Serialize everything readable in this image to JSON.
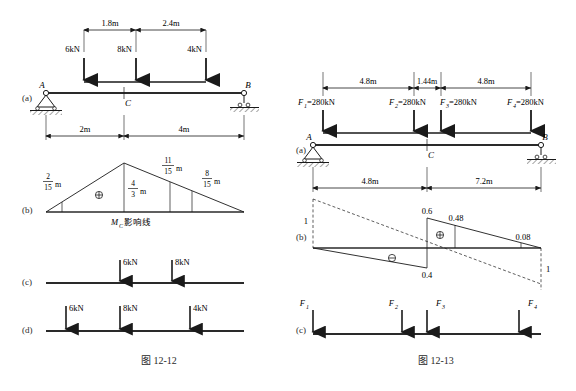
{
  "figures": [
    {
      "id": "fig-12-12",
      "caption": "图 12-12",
      "panels": [
        {
          "label": "(a)",
          "type": "beam-loading",
          "beam": {
            "left_support_label": "A",
            "right_support_label": "B",
            "mid_label": "C",
            "left_support_type": "pin",
            "right_support_type": "roller"
          },
          "loads": [
            {
              "label": "6kN",
              "value": 6,
              "unit": "kN"
            },
            {
              "label": "8kN",
              "value": 8,
              "unit": "kN"
            },
            {
              "label": "4kN",
              "value": 4,
              "unit": "kN"
            }
          ],
          "top_dimensions": [
            {
              "label": "1.8m",
              "value": 1.8
            },
            {
              "label": "2.4m",
              "value": 2.4
            }
          ],
          "bottom_dimensions": [
            {
              "label": "2m",
              "value": 2
            },
            {
              "label": "4m",
              "value": 4
            }
          ]
        },
        {
          "label": "(b)",
          "type": "influence-line",
          "title": "M",
          "title_sub": "C",
          "title_text": "影响线",
          "sign_positive": "⊕",
          "ordinates": [
            {
              "num": "2",
              "den": "15",
              "unit": "m"
            },
            {
              "num": "4",
              "den": "3",
              "unit": "m"
            },
            {
              "num": "11",
              "den": "15",
              "unit": "m"
            },
            {
              "num": "8",
              "den": "15",
              "unit": "m"
            }
          ]
        },
        {
          "label": "(c)",
          "type": "load-case",
          "loads": [
            {
              "label": "6kN"
            },
            {
              "label": "8kN"
            }
          ]
        },
        {
          "label": "(d)",
          "type": "load-case",
          "loads": [
            {
              "label": "6kN"
            },
            {
              "label": "8kN"
            },
            {
              "label": "4kN"
            }
          ]
        }
      ]
    },
    {
      "id": "fig-12-13",
      "caption": "图 12-13",
      "panels": [
        {
          "label": "(a)",
          "type": "beam-loading",
          "beam": {
            "left_support_label": "A",
            "right_support_label": "B",
            "mid_label": "C",
            "left_support_type": "pin",
            "right_support_type": "roller"
          },
          "loads": [
            {
              "name": "F",
              "sub": "1",
              "label": "=280kN"
            },
            {
              "name": "F",
              "sub": "2",
              "label": "=280kN"
            },
            {
              "name": "F",
              "sub": "3",
              "label": "=280kN"
            },
            {
              "name": "F",
              "sub": "4",
              "label": "=280kN"
            }
          ],
          "top_dimensions": [
            {
              "label": "4.8m",
              "value": 4.8
            },
            {
              "label": "1.44m",
              "value": 1.44
            },
            {
              "label": "4.8m",
              "value": 4.8
            }
          ],
          "bottom_dimensions": [
            {
              "label": "4.8m",
              "value": 4.8
            },
            {
              "label": "7.2m",
              "value": 7.2
            }
          ]
        },
        {
          "label": "(b)",
          "type": "influence-line",
          "sign_positive": "⊕",
          "sign_negative": "⊖",
          "ordinates": [
            {
              "label": "1",
              "position": "left-end"
            },
            {
              "label": "0.6",
              "position": "peak-top"
            },
            {
              "label": "0.48",
              "position": "mid-right-top"
            },
            {
              "label": "0.08",
              "position": "right-top"
            },
            {
              "label": "0.4",
              "position": "bottom-center"
            },
            {
              "label": "1",
              "position": "right-end"
            }
          ]
        },
        {
          "label": "(c)",
          "type": "load-case",
          "loads": [
            {
              "name": "F",
              "sub": "1"
            },
            {
              "name": "F",
              "sub": "2"
            },
            {
              "name": "F",
              "sub": "3"
            },
            {
              "name": "F",
              "sub": "4"
            }
          ]
        }
      ]
    }
  ]
}
